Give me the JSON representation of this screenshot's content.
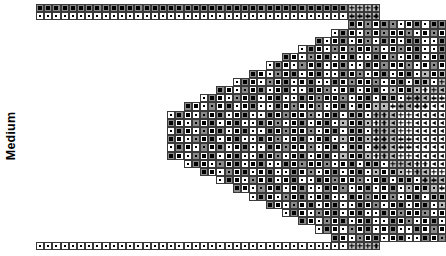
{
  "chart_data": {
    "type": "table",
    "title": "",
    "axis_label": "Medium",
    "legend": [
      {
        "symbol": "filled-square",
        "glyph": "■",
        "name": "dark-bead"
      },
      {
        "symbol": "dot",
        "glyph": "·",
        "name": "light-bead"
      },
      {
        "symbol": "plus",
        "glyph": "+",
        "name": "accent-bead"
      },
      {
        "symbol": "triangle-left",
        "glyph": "◁",
        "name": "highlight-bead"
      }
    ],
    "colors": {
      "cell_border": "#3a3a3a",
      "bg_white": "#ffffff",
      "bg_light": "#b9b9b9",
      "bg_dark": "#8a8a8a",
      "symbol": "#000000",
      "label": "#000000"
    },
    "grid": {
      "cell_size": 8.2,
      "origin_x": 36,
      "origin_y": 4,
      "columns": 49,
      "rows": 30,
      "xlabel": "",
      "ylabel": "Medium",
      "gridlines": true
    },
    "symbol_key": {
      "0": "empty",
      "1": "filled-square",
      "2": "dot",
      "3": "plus",
      "4": "triangle-left"
    },
    "bg_key": {
      "0": "none",
      "w": "white",
      "l": "light-gray",
      "d": "dark-gray"
    },
    "rows_spec": [
      {
        "start": 0,
        "sym": "1111111111111111111111111111111111111133330000000000",
        "bg": "ddddddddddddddddddddddddddddddddddddddllll0000000000"
      },
      {
        "start": 0,
        "sym": "2222222222222222222222222222222222222233330000000000",
        "bg": "wwwwwwwwwwwwwwwwwwwwwwwwwwwwwwwwwwwwwwllll0000000000"
      },
      {
        "start": 38,
        "sym": "112112211211221121121122113333330000000000000000000",
        "bg": "dwdwddwwdwddwwdwdwddwwdlllllll0000000000000000000000"
      },
      {
        "start": 36,
        "sym": "2112212112212112212112211333433000000000000000000000",
        "bg": "wdwwdwdwwdwwdwdwwdwwdllllwll000000000000000000000000"
      },
      {
        "start": 34,
        "sym": "121121221121122112112212133343344000000000000000000",
        "bg": "dwwdwwdwdwwddwwdwdwddllllwllww00000000000000000000000"
      },
      {
        "start": 32,
        "sym": "2112212112212112211211221233433444400000000000000000",
        "bg": "wdwwdwdwwdwwdwdwwdwwdwllwlllwwww0000000000000000000000"
      },
      {
        "start": 30,
        "sym": "11221121122112211211221123343344444000000000000000000",
        "bg": "dwwdwdwwdwwdwdwwdwwdwlwllwllwwwww000000000000000000000"
      },
      {
        "start": 28,
        "sym": "211221121122112112212112233343444444400000000000000000",
        "bg": "wdwwdwdwwdwwdwdwwdwwdwllwlllwwwwwww00000000000000000000"
      },
      {
        "start": 26,
        "sym": "1122112112211221121122112334334444444440000000000000000",
        "bg": "dwwdwdwwdwwdwdwwdwwdwlwllwllwwwwwwwww000000000000000000"
      },
      {
        "start": 24,
        "sym": "21122112112211211221121123343444444444440000000000000",
        "bg": "wdwwdwdwwdwwdwdwwdwwdwllwlllwwwwwwwwwww00000000000000"
      },
      {
        "start": 22,
        "sym": "112211211221122112112211233433444444444444000000000000",
        "bg": "dwwdwdwwdwwdwdwwdwwdwlwllwllwwwwwwwwwwwww00000000000000"
      },
      {
        "start": 20,
        "sym": "2112211211221121122112112334334444444444444400000000000",
        "bg": "wdwwdwdwwdwwdwdwwdwwdwllwlllwwwwwwwwwwwwwww000000000000"
      },
      {
        "start": 18,
        "sym": "11221121122112112211211223343344444444444444440000000000",
        "bg": "dwwdwdwwdwwdwdwwdwwdwlwllwllwwwwwwwwwwwwwwwww00000000000"
      },
      {
        "start": 16,
        "sym": "211221121122112112211211233433444444444444444433330000000",
        "bg": "wdwwdwdwwdwwdwdwwdwwdwllwlllwwwwwwwwwwwwwwwwwllll0000000"
      },
      {
        "start": 16,
        "sym": "112211211221122112112211233433444444444444444433332200000",
        "bg": "dwwdwdwwdwwdwdwwdwwdwlwllwllwwwwwwwwwwwwwwwwwllllww00000"
      },
      {
        "start": 16,
        "sym": "21122112112211211221121123343344444444444444444444112000",
        "bg": "wdwwdwdwwdwwdwdwwdwwdwllwlllwwwwwwwwwwwwwwwwwwwwddw000"
      },
      {
        "start": 16,
        "sym": "112211211221122112112211233433444444444444444444112200",
        "bg": "dwwdwdwwdwwdwdwwdwwdwlwllwllwwwwwwwwwwwwwwwwwwddww00"
      },
      {
        "start": 16,
        "sym": "211221121122112112211211233433444444444444444433332200000",
        "bg": "wdwwdwdwwdwwdwdwwdwwdwllwlllwwwwwwwwwwwwwwwwwllllww00000"
      },
      {
        "start": 16,
        "sym": "112211211221122112112211233433444444444444444433330000000",
        "bg": "dwwdwdwwdwwdwdwwdwwdwlwllwllwwwwwwwwwwwwwwwwwllll0000000"
      },
      {
        "start": 18,
        "sym": "21122112112211211221121123343344444444444444440000000000",
        "bg": "wdwwdwdwwdwwdwdwwdwwdwllwlllwwwwwwwwwwwwwwwww00000000000"
      },
      {
        "start": 20,
        "sym": "1122112112211221121122112334334444444444444400000000000",
        "bg": "dwwdwdwwdwwdwdwwdwwdwlwllwllwwwwwwwwwwwwwww000000000000"
      },
      {
        "start": 22,
        "sym": "211221121122112112211211233433444444444444000000000000",
        "bg": "wdwwdwdwwdwwdwdwwdwwdwllwlllwwwwwwwwwwwww00000000000000"
      },
      {
        "start": 24,
        "sym": "11221121122112211211221123343444444444440000000000000",
        "bg": "dwwdwdwwdwwdwdwwdwwdwlwllwllwwwwwwwwwww00000000000000"
      },
      {
        "start": 26,
        "sym": "2112211211221121122112112334334444444440000000000000000",
        "bg": "wdwwdwdwwdwwdwdwwdwwdwllwlllwwwwwwwwwww000000000000000"
      },
      {
        "start": 28,
        "sym": "112211211221122112112211233433444444400000000000000000",
        "bg": "dwwdwdwwdwwdwdwwdwwdwlwllwllwwwwwww00000000000000000000"
      },
      {
        "start": 30,
        "sym": "21122112112211211221121123343344444000000000000000000",
        "bg": "wdwwdwdwwdwwdwdwwdwwdwllwlllwwwww000000000000000000000"
      },
      {
        "start": 32,
        "sym": "112211211221122112112211233433444400000000000000000",
        "bg": "dwwdwdwwdwwdwdwwdwwdwlwllwllwwww0000000000000000000000"
      },
      {
        "start": 34,
        "sym": "211221121122112112211211233433440000000000000000000",
        "bg": "wdwwdwdwwdwwdwdwwdwwdwllwlllww00000000000000000000000"
      },
      {
        "start": 36,
        "sym": "1122112112211221121122112334333000000000000000000000",
        "bg": "dwwdwdwwdwwdwdwwdwwdwlwllwlll000000000000000000000000"
      },
      {
        "start": 0,
        "sym": "2222222222222222222222222222222222222233330000000000",
        "bg": "wwwwwwwwwwwwwwwwwwwwwwwwwwwwwwwwwwwwwwllll0000000000"
      }
    ]
  }
}
